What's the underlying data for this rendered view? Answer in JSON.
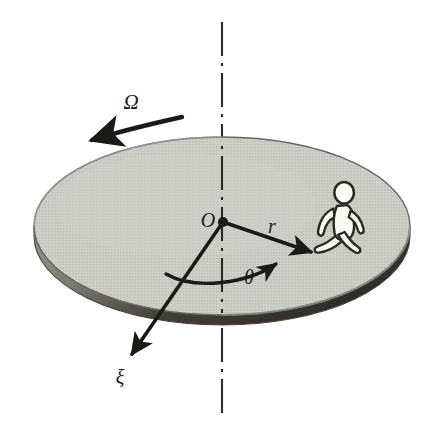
{
  "figure": {
    "background_color": "#ffffff",
    "width": 428,
    "height": 431
  },
  "disk": {
    "name": "rotating-disk",
    "top_fill_color": "#c9c9c3",
    "rim_fill_color": "#8f8f88",
    "rim_shadow_color": "#3d3a33",
    "outline_color": "#5a574f",
    "center_x": 222,
    "center_y": 226,
    "radius_x": 188,
    "radius_y": 89,
    "thickness": 16
  },
  "axis": {
    "name": "rotation-axis",
    "style": "dash-dot",
    "color": "#2b2a26",
    "x": 222,
    "y_top": 22,
    "y_bottom": 414
  },
  "labels": {
    "omega": "Ω",
    "origin": "O",
    "radius": "r",
    "theta": "θ",
    "xi": "ξ"
  },
  "label_positions": {
    "omega": {
      "x": 131,
      "y": 104
    },
    "origin": {
      "x": 208,
      "y": 222
    },
    "radius": {
      "x": 272,
      "y": 228
    },
    "theta": {
      "x": 249,
      "y": 279
    },
    "xi": {
      "x": 120,
      "y": 379
    }
  },
  "vectors": [
    {
      "name": "radius-vector",
      "label": "r",
      "from_x": 223,
      "from_y": 222,
      "to_x": 315,
      "to_y": 253,
      "color": "#1a1a18"
    },
    {
      "name": "xi-axis-vector",
      "label": "ξ",
      "from_x": 223,
      "from_y": 222,
      "to_x": 128,
      "to_y": 360,
      "color": "#1a1a18"
    }
  ],
  "angle_arc": {
    "name": "theta-angle-arc",
    "label": "θ",
    "color": "#1a1a18",
    "start_x": 166,
    "start_y": 275,
    "end_x": 279,
    "end_y": 265
  },
  "rotation_arrow": {
    "name": "rotation-direction-arrow",
    "label": "Ω",
    "direction": "counterclockwise-leftward",
    "color": "#1a1a18",
    "start_x": 182,
    "start_y": 117,
    "end_x": 87,
    "end_y": 141
  },
  "person": {
    "name": "walking-person-pictogram",
    "fill_color": "#fbfbf6",
    "outline_color": "#2b2a26",
    "x": 337,
    "y": 216
  }
}
